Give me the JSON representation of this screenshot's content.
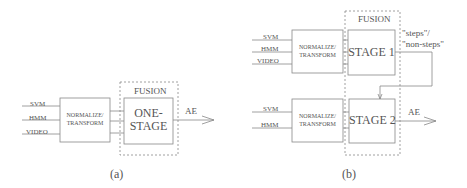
{
  "diagram_a": {
    "inputs": [
      "SVM",
      "HMM",
      "VIDEO"
    ],
    "normalize_label_1": "NORMALIZE/",
    "normalize_label_2": "TRANSFORM",
    "fusion_label": "FUSION",
    "stage_label_1": "ONE-",
    "stage_label_2": "STAGE",
    "output_label": "AE",
    "caption": "(a)"
  },
  "diagram_b": {
    "top": {
      "inputs": [
        "SVM",
        "HMM",
        "VIDEO"
      ],
      "normalize_label_1": "NORMALIZE/",
      "normalize_label_2": "TRANSFORM",
      "stage_label": "STAGE 1",
      "decision_label_1": "\"steps\"/",
      "decision_label_2": "\"non-steps\""
    },
    "bottom": {
      "inputs": [
        "SVM",
        "HMM"
      ],
      "normalize_label_1": "NORMALIZE/",
      "normalize_label_2": "TRANSFORM",
      "stage_label": "STAGE 2",
      "output_label": "AE"
    },
    "fusion_label": "FUSION",
    "caption": "(b)"
  }
}
